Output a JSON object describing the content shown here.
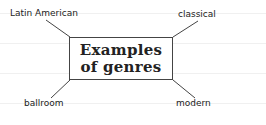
{
  "center": {
    "line1": "Examples",
    "line2": "of genres"
  },
  "branches": [
    {
      "label": "Latin American",
      "position": "top-left"
    },
    {
      "label": "classical",
      "position": "top-right"
    },
    {
      "label": "ballroom",
      "position": "bottom-left"
    },
    {
      "label": "modern",
      "position": "bottom-right"
    }
  ]
}
